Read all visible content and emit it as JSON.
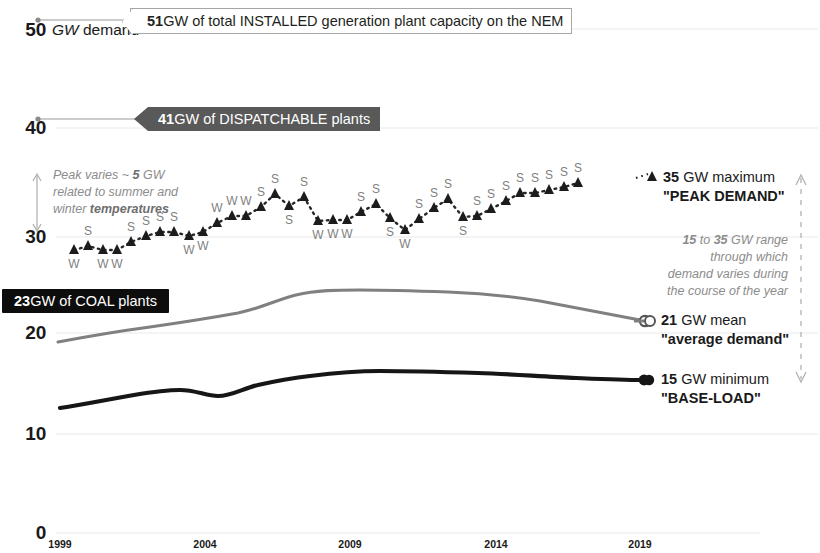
{
  "chart_data": {
    "type": "line",
    "title": "",
    "xlabel": "",
    "ylabel": "GW demand",
    "xlim": [
      1999,
      2020.5
    ],
    "ylim": [
      0,
      50
    ],
    "grid": true,
    "legend_position": "right-inline",
    "xticks": [
      "1999",
      "2004",
      "2009",
      "2014",
      "2019"
    ],
    "yticks": [
      "0",
      "10",
      "20",
      "30",
      "40",
      "50"
    ],
    "series": [
      {
        "name": "maximum / PEAK DEMAND",
        "style": "dotted-with-triangle-markers",
        "color": "#262626",
        "x": [
          1999.5,
          2000.0,
          2000.5,
          2001.0,
          2001.5,
          2002.0,
          2002.5,
          2003.0,
          2003.5,
          2004.0,
          2004.5,
          2005.0,
          2005.5,
          2006.0,
          2006.5,
          2007.0,
          2007.5,
          2008.0,
          2008.5,
          2009.0,
          2009.5,
          2010.0,
          2010.5,
          2011.0,
          2011.5,
          2012.0,
          2012.5,
          2013.0,
          2013.5,
          2014.0,
          2014.5,
          2015.0,
          2015.5,
          2016.0,
          2016.5,
          2017.0
        ],
        "y": [
          28.3,
          28.7,
          28.3,
          28.3,
          29.1,
          29.7,
          30.1,
          30.1,
          29.7,
          30.1,
          31.0,
          31.7,
          31.7,
          32.6,
          33.9,
          32.7,
          33.6,
          31.2,
          31.3,
          31.3,
          32.1,
          32.9,
          31.5,
          30.3,
          31.4,
          32.5,
          33.4,
          31.6,
          31.7,
          32.4,
          33.2,
          34.0,
          34.0,
          34.3,
          34.6,
          35.0
        ],
        "season_labels": [
          "W",
          "S",
          "W",
          "W",
          "S",
          "S",
          "S",
          "S",
          "W",
          "W",
          "W",
          "W",
          "W",
          "S",
          "S",
          "S",
          "S",
          "W",
          "W",
          "W",
          "S",
          "S",
          "S",
          "W",
          "S",
          "S",
          "S",
          "S",
          "S",
          "S",
          "S",
          "S",
          "S",
          "S",
          "S",
          "S"
        ]
      },
      {
        "name": "mean / average demand",
        "style": "solid-grey",
        "color": "#808080",
        "x": [
          1999,
          2001,
          2003,
          2005,
          2007,
          2008,
          2009,
          2010,
          2012,
          2014,
          2016,
          2018,
          2020
        ],
        "y": [
          19.2,
          20.1,
          20.8,
          21.2,
          21.6,
          22.3,
          22.9,
          23.1,
          23.1,
          22.9,
          22.6,
          22.2,
          21.0
        ]
      },
      {
        "name": "minimum / BASE-LOAD",
        "style": "solid-black",
        "color": "#161616",
        "x": [
          1999,
          2001,
          2003,
          2004,
          2005,
          2006,
          2007,
          2008,
          2009,
          2010,
          2012,
          2014,
          2016,
          2018,
          2020
        ],
        "y": [
          12.5,
          13.3,
          13.9,
          14.3,
          13.9,
          14.1,
          14.6,
          15.2,
          15.5,
          15.6,
          15.3,
          15.2,
          15.1,
          15.1,
          15.0
        ]
      }
    ],
    "reference_levels": [
      {
        "label": "51 GW of total INSTALLED generation plant capacity on the NEM",
        "value": 51
      },
      {
        "label": "41 GW of DISPATCHABLE plants",
        "value": 41
      },
      {
        "label": "23 GW of COAL plants",
        "value": 23
      }
    ]
  },
  "axis": {
    "unit_label_number": "50",
    "unit_label_italic": "GW",
    "unit_label_rest": "demand",
    "yticks": [
      "50",
      "40",
      "30",
      "20",
      "10",
      "0"
    ],
    "xticks": [
      "1999",
      "2004",
      "2009",
      "2014",
      "2019"
    ]
  },
  "callouts": {
    "installed": {
      "lead": "51",
      "text": " GW of total INSTALLED generation plant capacity on the NEM"
    },
    "dispatchable": {
      "lead": "41",
      "text": " GW of DISPATCHABLE plants"
    },
    "coal": {
      "lead": "23",
      "text": " GW of COAL plants"
    }
  },
  "annotations": {
    "peak_variation": {
      "line1": "Peak varies ~ ",
      "line1_bold": "5",
      "line1_rest": " GW",
      "line2": "related to summer and",
      "line3": "winter ",
      "line3_bold": "temperatures"
    },
    "range_note": {
      "line1_bold_a": "15",
      "line1_mid": " to ",
      "line1_bold_b": "35",
      "line1_rest": " GW range",
      "line2": "through which",
      "line3": "demand varies during",
      "line4": "the course of the year"
    }
  },
  "legend": {
    "peak": {
      "lead": "35",
      "unit": " GW maximum",
      "quote": "\"PEAK DEMAND\""
    },
    "mean": {
      "lead": "21",
      "unit": " GW mean",
      "quote": "\"average demand\""
    },
    "min": {
      "lead": "15",
      "unit": " GW minimum",
      "quote": "\"BASE-LOAD\""
    }
  },
  "colors": {
    "peak_series": "#262626",
    "mean_series": "#808080",
    "min_series": "#161616",
    "banner_dispatchable": "#595959",
    "banner_coal": "#0d0d0d",
    "grid": "#e8e8e8",
    "muted_text": "#8c8c8c"
  }
}
